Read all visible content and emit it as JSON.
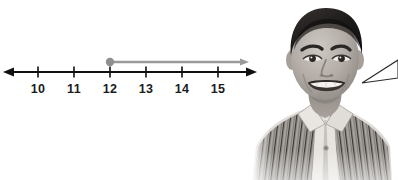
{
  "canvas": {
    "width": 398,
    "height": 180,
    "background": "#ffffff"
  },
  "numberline": {
    "name": "number-line",
    "axis_color": "#111111",
    "ray_color": "#9a9a9a",
    "label_color": "#1b1b1b",
    "axis_y": 72,
    "ray_y": 62,
    "left_arrow_x": 5,
    "right_arrow_x": 255,
    "tick_spacing": 36,
    "ticks": [
      {
        "label": "10",
        "value": 10,
        "x": 38
      },
      {
        "label": "11",
        "value": 11,
        "x": 74
      },
      {
        "label": "12",
        "value": 12,
        "x": 110
      },
      {
        "label": "13",
        "value": 13,
        "x": 146
      },
      {
        "label": "14",
        "value": 14,
        "x": 182
      },
      {
        "label": "15",
        "value": 15,
        "x": 218
      }
    ],
    "ray": {
      "name": "solution-ray",
      "endpoint_value": 12,
      "endpoint_x": 110,
      "endpoint_style": "closed-dot",
      "direction": "right",
      "arrow_x": 248
    }
  },
  "photo": {
    "name": "student-photo",
    "subject": "smiling boy in striped collared shirt",
    "style": "grayscale photograph",
    "skin": "#b9b2ac",
    "hair": "#1f1d1c",
    "shirt_light": "#dedbd6",
    "shirt_dark": "#4a4745"
  },
  "speech_tail": {
    "name": "speech-bubble-tail",
    "color": "#2b2b2b",
    "points": "22,35 58,12 58,30"
  }
}
